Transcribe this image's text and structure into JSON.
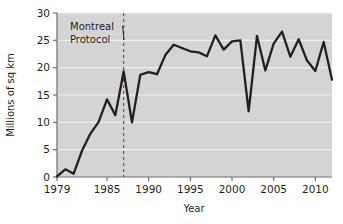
{
  "chart_data": {
    "type": "line",
    "title": "",
    "subtitle": "",
    "xlabel": "Year",
    "ylabel": "Millions of sq km",
    "xlim": [
      1979,
      2012
    ],
    "ylim": [
      0,
      30
    ],
    "xticks": [
      1979,
      1985,
      1990,
      1995,
      2000,
      2005,
      2010
    ],
    "xticklabels": [
      "1979",
      "1985",
      "1990",
      "1995",
      "2000",
      "2005",
      "2010"
    ],
    "yticks": [
      0,
      5,
      10,
      15,
      20,
      25,
      30
    ],
    "yticklabels": [
      "0",
      "5",
      "10",
      "15",
      "20",
      "25",
      "30"
    ],
    "grid": true,
    "grid_axis": "y",
    "legend": false,
    "plot_background": "#d4d4d4",
    "grid_color": "#f0f0f0",
    "line_color": "#231f20",
    "axis_color": "#6e6e6e",
    "series": [
      {
        "name": "Antarctic ozone hole area",
        "x": [
          1979,
          1980,
          1981,
          1982,
          1983,
          1984,
          1985,
          1986,
          1987,
          1988,
          1989,
          1990,
          1991,
          1992,
          1993,
          1994,
          1995,
          1996,
          1997,
          1998,
          1999,
          2000,
          2001,
          2002,
          2003,
          2004,
          2005,
          2006,
          2007,
          2008,
          2009,
          2010,
          2011,
          2012
        ],
        "values": [
          0.1,
          1.4,
          0.6,
          4.8,
          7.9,
          10.1,
          14.2,
          11.3,
          19.3,
          10.0,
          18.7,
          19.2,
          18.8,
          22.3,
          24.2,
          23.6,
          23.0,
          22.8,
          22.1,
          25.9,
          23.3,
          24.8,
          25.0,
          12.0,
          25.8,
          19.5,
          24.4,
          26.6,
          22.0,
          25.2,
          21.3,
          19.4,
          24.7,
          17.8
        ]
      }
    ],
    "annotations": [
      {
        "name": "montreal-protocol",
        "text_line1": "Montreal",
        "text_line2": "Protocol",
        "x_value": 1987,
        "style": "dashed-vertical-line-with-leader"
      }
    ]
  },
  "axis": {
    "ylabel": "Millions of sq km",
    "xlabel": "Year"
  }
}
